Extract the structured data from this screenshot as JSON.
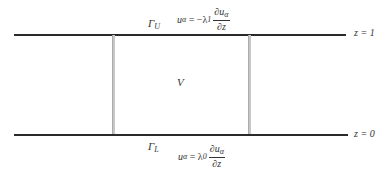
{
  "diagram": {
    "region_label": "V",
    "upper_boundary": {
      "label_main": "Γ",
      "label_sub": "U",
      "equation": {
        "lhs": "u",
        "lhs_sub": "α",
        "op": " = −λ",
        "coef_sub": "1",
        "frac_num": "∂u",
        "frac_num_sub": "α",
        "frac_den": "∂z"
      },
      "level_label": "z = 1"
    },
    "lower_boundary": {
      "label_main": "Γ",
      "label_sub": "L",
      "equation": {
        "lhs": "u",
        "lhs_sub": "α",
        "op": " = λ",
        "coef_sub": "0",
        "frac_num": "∂u",
        "frac_num_sub": "α",
        "frac_den": "∂z"
      },
      "level_label": "z = 0"
    },
    "colors": {
      "boundary_line": "#2a2a2a",
      "side_line": "#c8c8c8"
    }
  }
}
